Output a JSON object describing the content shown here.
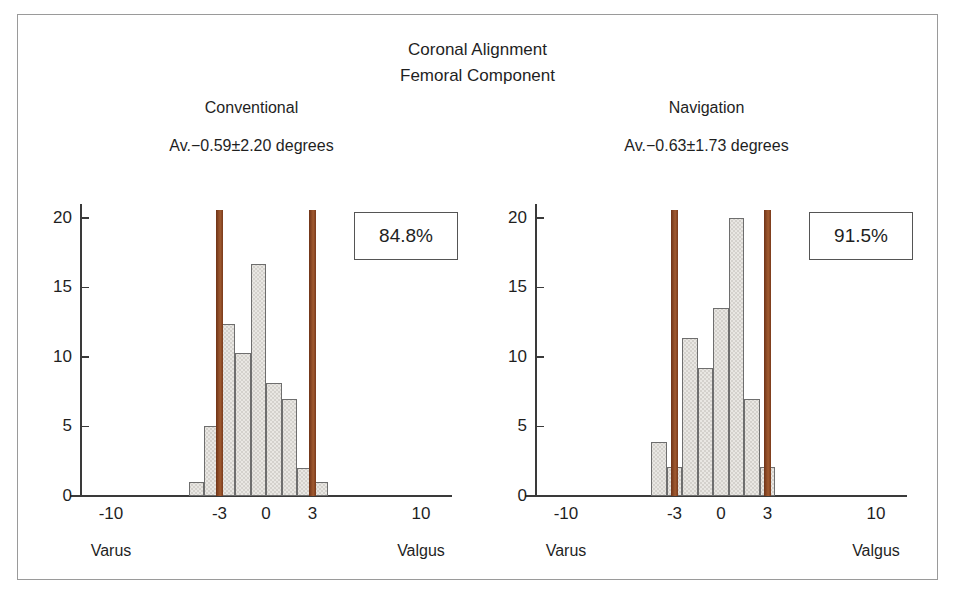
{
  "figure": {
    "title_line1": "Coronal Alignment",
    "title_line2": "Femoral Component",
    "frame_color": "#9a9a9a",
    "bar_fill": "#e9e7e3",
    "bar_stroke": "#6e6e6e",
    "marker_color": "#8c4a26",
    "axis_color": "#3a3a3a"
  },
  "chart_data": [
    {
      "type": "bar",
      "title": "Conventional",
      "subtitle": "Av.−0.59±2.20 degrees",
      "xlabel": "",
      "ylabel": "",
      "xlim": [
        -12,
        12
      ],
      "ylim": [
        0,
        21
      ],
      "grid": false,
      "legend": "none",
      "xticks": [
        -10,
        -3,
        0,
        3,
        10
      ],
      "xticklabels": [
        "-10",
        "-3",
        "0",
        "3",
        "10"
      ],
      "yticks": [
        0,
        5,
        10,
        15,
        20
      ],
      "yticklabels": [
        "0",
        "5",
        "10",
        "15",
        "20"
      ],
      "axis_end_labels": {
        "left": "Varus",
        "right": "Valgus"
      },
      "bin_width": 1,
      "bin_centers": [
        -4.5,
        -3.5,
        -2.5,
        -1.5,
        -0.5,
        0.5,
        1.5,
        2.5,
        3.5
      ],
      "values": [
        1.0,
        5.0,
        12.4,
        10.3,
        16.7,
        8.1,
        7.0,
        2.0,
        1.0
      ],
      "reference_lines": [
        -3,
        3
      ],
      "reference_line_top": 20.6,
      "annotation_box": "84.8%"
    },
    {
      "type": "bar",
      "title": "Navigation",
      "subtitle": "Av.−0.63±1.73 degrees",
      "xlabel": "",
      "ylabel": "",
      "xlim": [
        -12,
        12
      ],
      "ylim": [
        0,
        21
      ],
      "grid": false,
      "legend": "none",
      "xticks": [
        -10,
        -3,
        0,
        3,
        10
      ],
      "xticklabels": [
        "-10",
        "-3",
        "0",
        "3",
        "10"
      ],
      "yticks": [
        0,
        5,
        10,
        15,
        20
      ],
      "yticklabels": [
        "0",
        "5",
        "10",
        "15",
        "20"
      ],
      "axis_end_labels": {
        "left": "Varus",
        "right": "Valgus"
      },
      "bin_width": 1,
      "bin_centers": [
        -4.0,
        -3.0,
        -2.0,
        -1.0,
        0.0,
        1.0,
        2.0,
        3.0
      ],
      "values": [
        3.9,
        2.1,
        11.4,
        9.2,
        13.5,
        20.0,
        7.0,
        2.1
      ],
      "reference_lines": [
        -3,
        3
      ],
      "reference_line_top": 20.6,
      "annotation_box": "91.5%"
    }
  ],
  "caption_partial": ""
}
